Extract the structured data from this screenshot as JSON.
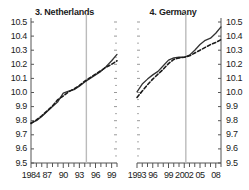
{
  "figure": {
    "panels": [
      {
        "id": "netherlands",
        "title": "3. Netherlands",
        "axis_side": "left",
        "yticks": [
          "10.5",
          "10.4",
          "10.3",
          "10.2",
          "10.1",
          "10.0",
          "9.9",
          "9.8",
          "9.7",
          "9.6",
          "9.5"
        ],
        "xticks": [
          "1984",
          "87",
          "90",
          "93",
          "96",
          "99"
        ]
      },
      {
        "id": "germany",
        "title": "4. Germany",
        "axis_side": "right",
        "yticks": [
          "10.5",
          "10.4",
          "10.3",
          "10.2",
          "10.1",
          "10.0",
          "9.9",
          "9.8",
          "9.7",
          "9.6",
          "9.5"
        ],
        "xticks": [
          "1993",
          "96",
          "99",
          "2002",
          "05",
          "08"
        ]
      }
    ],
    "colors": {
      "solid_line": "#333333",
      "dashed_line": "#1a1a1a",
      "reference_line": "#bbbbbb",
      "axis": "#555555",
      "text": "#1a1a1a"
    }
  },
  "chart_data": [
    {
      "type": "line",
      "title": "3. Netherlands",
      "xlabel": "",
      "ylabel": "",
      "ylim": [
        9.5,
        10.5
      ],
      "xlim": [
        1984,
        2000
      ],
      "grid": false,
      "legend": "none",
      "ytick_values": [
        9.5,
        9.6,
        9.7,
        9.8,
        9.9,
        10.0,
        10.1,
        10.2,
        10.3,
        10.4,
        10.5
      ],
      "xtick_values": [
        1984,
        1987,
        1990,
        1993,
        1996,
        1999
      ],
      "xtick_labels": [
        "1984",
        "87",
        "90",
        "93",
        "96",
        "99"
      ],
      "annotations": [
        {
          "type": "vertical-reference-line",
          "x": 1994.3
        }
      ],
      "x": [
        1984,
        1985,
        1986,
        1987,
        1988,
        1989,
        1990,
        1991,
        1992,
        1993,
        1994,
        1995,
        1996,
        1997,
        1998,
        1999,
        2000
      ],
      "series": [
        {
          "name": "solid",
          "style": "solid",
          "values": [
            9.785,
            9.8,
            9.83,
            9.865,
            9.9,
            9.935,
            9.995,
            10.01,
            10.02,
            10.045,
            10.075,
            10.1,
            10.125,
            10.15,
            10.185,
            10.225,
            10.27
          ]
        },
        {
          "name": "dashed",
          "style": "dashed",
          "values": [
            9.78,
            9.805,
            9.835,
            9.87,
            9.905,
            9.95,
            9.975,
            10.005,
            10.025,
            10.05,
            10.08,
            10.105,
            10.13,
            10.155,
            10.18,
            10.2,
            10.225
          ]
        }
      ]
    },
    {
      "type": "line",
      "title": "4. Germany",
      "xlabel": "",
      "ylabel": "",
      "ylim": [
        9.5,
        10.5
      ],
      "xlim": [
        1993,
        2009
      ],
      "grid": false,
      "legend": "none",
      "ytick_values": [
        9.5,
        9.6,
        9.7,
        9.8,
        9.9,
        10.0,
        10.1,
        10.2,
        10.3,
        10.4,
        10.5
      ],
      "xtick_values": [
        1993,
        1996,
        1999,
        2002,
        2005,
        2008
      ],
      "xtick_labels": [
        "1993",
        "96",
        "99",
        "2002",
        "05",
        "08"
      ],
      "annotations": [
        {
          "type": "vertical-reference-line",
          "x": 2002.3
        }
      ],
      "x": [
        1993,
        1994,
        1995,
        1996,
        1997,
        1998,
        1999,
        2000,
        2001,
        2002,
        2003,
        2004,
        2005,
        2006,
        2007,
        2008,
        2009
      ],
      "series": [
        {
          "name": "solid",
          "style": "solid",
          "values": [
            10.005,
            10.06,
            10.095,
            10.125,
            10.15,
            10.19,
            10.23,
            10.245,
            10.25,
            10.25,
            10.265,
            10.3,
            10.34,
            10.37,
            10.385,
            10.42,
            10.465
          ]
        },
        {
          "name": "dashed",
          "style": "dashed",
          "values": [
            9.965,
            10.01,
            10.055,
            10.095,
            10.13,
            10.165,
            10.205,
            10.235,
            10.245,
            10.25,
            10.26,
            10.28,
            10.3,
            10.32,
            10.34,
            10.355,
            10.375
          ]
        }
      ]
    }
  ]
}
